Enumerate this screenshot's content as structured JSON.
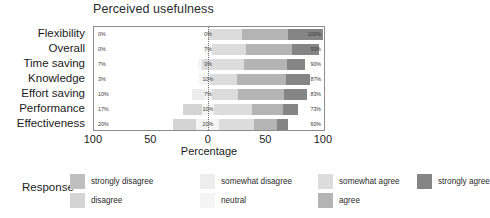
{
  "chart_data": {
    "type": "bar",
    "subtype": "diverging-stacked-likert",
    "title": "Perceived usefulness",
    "xlabel": "Percentage",
    "ylabel": "",
    "grid": false,
    "legend_position": "bottom",
    "legend_title": "Response",
    "xlim": [
      -100,
      100
    ],
    "xticks": [
      {
        "label": "100",
        "value": -100
      },
      {
        "label": "50",
        "value": -50
      },
      {
        "label": "0",
        "value": 0
      },
      {
        "label": "50",
        "value": 50
      },
      {
        "label": "100",
        "value": 100
      }
    ],
    "categories": [
      "Flexibility",
      "Overall",
      "Time saving",
      "Knowledge",
      "Effort saving",
      "Performance",
      "Effectiveness"
    ],
    "response_levels": [
      "strongly disagree",
      "disagree",
      "somewhat disagree",
      "neutral",
      "somewhat agree",
      "agree",
      "strongly agree"
    ],
    "colors": {
      "strongly disagree": "#bfbfbf",
      "disagree": "#d4d4d4",
      "somewhat disagree": "#ededed",
      "neutral": "#f4f4f4",
      "somewhat agree": "#dcdcdc",
      "agree": "#b4b4b4",
      "strongly agree": "#858585"
    },
    "annotations": {
      "left_label": "percent negative (disagree side)",
      "mid_label": "percent neutral",
      "right_label": "percent positive (agree side)"
    },
    "rows": [
      {
        "category": "Flexibility",
        "left_pct": "0%",
        "mid_pct": "0%",
        "right_pct": "100%",
        "negative": 0,
        "neutral": 0,
        "positive": 100,
        "segments": [
          {
            "level": "somewhat agree",
            "value": 30
          },
          {
            "level": "agree",
            "value": 40
          },
          {
            "level": "strongly agree",
            "value": 30
          }
        ]
      },
      {
        "category": "Overall",
        "left_pct": "0%",
        "mid_pct": "7%",
        "right_pct": "93%",
        "negative": 0,
        "neutral": 7,
        "positive": 93,
        "segments": [
          {
            "level": "neutral",
            "value": 7
          },
          {
            "level": "somewhat agree",
            "value": 30
          },
          {
            "level": "agree",
            "value": 40
          },
          {
            "level": "strongly agree",
            "value": 23
          }
        ]
      },
      {
        "category": "Time saving",
        "left_pct": "7%",
        "mid_pct": "3%",
        "right_pct": "90%",
        "negative": 7,
        "neutral": 3,
        "positive": 90,
        "segments": [
          {
            "level": "neutral",
            "value": 3
          },
          {
            "level": "somewhat agree",
            "value": 37
          },
          {
            "level": "agree",
            "value": 37
          },
          {
            "level": "strongly agree",
            "value": 16
          }
        ]
      },
      {
        "category": "Knowledge",
        "left_pct": "3%",
        "mid_pct": "10%",
        "right_pct": "87%",
        "negative": 3,
        "neutral": 10,
        "positive": 87,
        "segments": [
          {
            "level": "neutral",
            "value": 10
          },
          {
            "level": "somewhat agree",
            "value": 23
          },
          {
            "level": "agree",
            "value": 43
          },
          {
            "level": "strongly agree",
            "value": 21
          }
        ]
      },
      {
        "category": "Effort saving",
        "left_pct": "10%",
        "mid_pct": "7%",
        "right_pct": "83%",
        "negative": 10,
        "neutral": 7,
        "positive": 83,
        "segments": [
          {
            "level": "somewhat disagree",
            "value": 10
          },
          {
            "level": "neutral",
            "value": 7
          },
          {
            "level": "somewhat agree",
            "value": 23
          },
          {
            "level": "agree",
            "value": 40
          },
          {
            "level": "strongly agree",
            "value": 20
          }
        ]
      },
      {
        "category": "Performance",
        "left_pct": "17%",
        "mid_pct": "10%",
        "right_pct": "73%",
        "negative": 17,
        "neutral": 10,
        "positive": 73,
        "segments": [
          {
            "level": "disagree",
            "value": 17
          },
          {
            "level": "neutral",
            "value": 10
          },
          {
            "level": "somewhat agree",
            "value": 33
          },
          {
            "level": "agree",
            "value": 27
          },
          {
            "level": "strongly agree",
            "value": 13
          }
        ]
      },
      {
        "category": "Effectiveness",
        "left_pct": "20%",
        "mid_pct": "20%",
        "right_pct": "60%",
        "negative": 20,
        "neutral": 20,
        "positive": 60,
        "segments": [
          {
            "level": "disagree",
            "value": 20
          },
          {
            "level": "neutral",
            "value": 20
          },
          {
            "level": "somewhat agree",
            "value": 30
          },
          {
            "level": "agree",
            "value": 20
          },
          {
            "level": "strongly agree",
            "value": 10
          }
        ]
      }
    ]
  }
}
